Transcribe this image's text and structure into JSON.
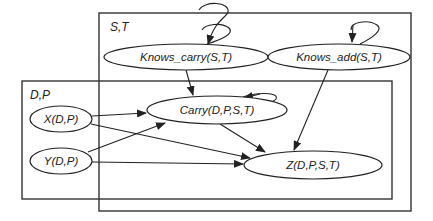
{
  "diagram": {
    "type": "plate-notation graphical model",
    "plates": [
      {
        "id": "plate_st",
        "label": "S,T",
        "x": 99,
        "y": 13,
        "width": 312,
        "height": 198
      },
      {
        "id": "plate_dp",
        "label": "D,P",
        "x": 22,
        "y": 81,
        "width": 370,
        "height": 118
      }
    ],
    "nodes": [
      {
        "id": "knows_carry",
        "label": "Knows_carry(S,T)",
        "cx": 186,
        "cy": 57,
        "rx": 82,
        "ry": 13,
        "self_loop": true
      },
      {
        "id": "knows_add",
        "label": "Knows_add(S,T)",
        "cx": 339,
        "cy": 57,
        "rx": 71,
        "ry": 13,
        "self_loop": true
      },
      {
        "id": "carry",
        "label": "Carry(D,P,S,T)",
        "cx": 217,
        "cy": 110,
        "rx": 70,
        "ry": 14,
        "self_loop": true
      },
      {
        "id": "x",
        "label": "X(D,P)",
        "cx": 61,
        "cy": 119,
        "rx": 31,
        "ry": 13,
        "self_loop": false
      },
      {
        "id": "y",
        "label": "Y(D,P)",
        "cx": 61,
        "cy": 161,
        "rx": 31,
        "ry": 13,
        "self_loop": false
      },
      {
        "id": "z",
        "label": "Z(D,P,S,T)",
        "cx": 313,
        "cy": 165,
        "rx": 69,
        "ry": 14,
        "self_loop": false
      }
    ],
    "edges": [
      {
        "from": "knows_carry",
        "to": "knows_carry"
      },
      {
        "from": "knows_add",
        "to": "knows_add"
      },
      {
        "from": "carry",
        "to": "carry"
      },
      {
        "from": "knows_carry",
        "to": "carry"
      },
      {
        "from": "knows_add",
        "to": "z"
      },
      {
        "from": "x",
        "to": "carry"
      },
      {
        "from": "y",
        "to": "carry"
      },
      {
        "from": "x",
        "to": "z"
      },
      {
        "from": "y",
        "to": "z"
      },
      {
        "from": "carry",
        "to": "z"
      }
    ],
    "colors": {
      "stroke": "#222222",
      "plate_stroke": "#333333",
      "background": "#ffffff"
    }
  }
}
